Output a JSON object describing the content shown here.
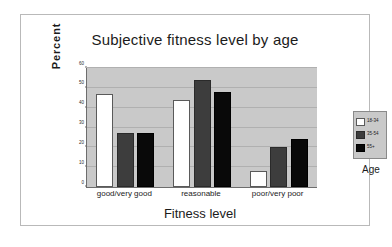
{
  "figure": {
    "title": "Subjective fitness level by age",
    "legend_title": "Age"
  },
  "chart_data": {
    "type": "bar",
    "title": "Subjective fitness level by age",
    "xlabel": "Fitness level",
    "ylabel": "Percent",
    "categories": [
      "good/very good",
      "reasonable",
      "poor/very poor"
    ],
    "series": [
      {
        "name": "18-34",
        "color": "#ffffff",
        "values": [
          47,
          44,
          8
        ]
      },
      {
        "name": "35-54",
        "color": "#3d3d3d",
        "values": [
          27,
          54,
          20
        ]
      },
      {
        "name": "55+",
        "color": "#090909",
        "values": [
          27,
          48,
          24
        ]
      }
    ],
    "ylim": [
      0,
      60
    ],
    "yticks": [
      0,
      10,
      20,
      30,
      40,
      50,
      60
    ],
    "ytick_labels": [
      "0",
      "10",
      "20",
      "30",
      "40",
      "50",
      "60"
    ],
    "grid": true,
    "legend_position": "right",
    "plot_background": "#c9c9c9",
    "figure_background": "#ffffff"
  }
}
